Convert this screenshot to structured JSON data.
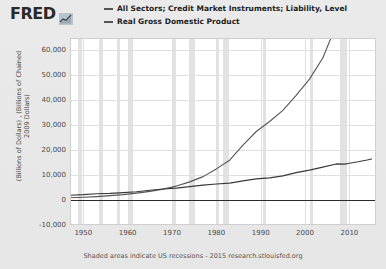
{
  "header": {
    "logo_text": "FRED",
    "logo_icon": "mini-line-chart-icon"
  },
  "legend": {
    "items": [
      {
        "label": "All Sectors; Credit Market Instruments; Liability, Level",
        "color": "#555555"
      },
      {
        "label": "Real Gross Domestic Product",
        "color": "#555555"
      }
    ]
  },
  "footer": {
    "note": "Shaded areas indicate US recessions - 2015 research.stlouisfed.org"
  },
  "chart_data": {
    "type": "line",
    "title": "",
    "subtitle": "",
    "xlabel": "",
    "ylabel": "(Billions of Dollars) , (Billions of Chained 2009 Dollars)",
    "xlim": [
      1947,
      2016
    ],
    "ylim": [
      -10000,
      65000
    ],
    "xticks": [
      "1950",
      "1960",
      "1970",
      "1980",
      "1990",
      "2000",
      "2010"
    ],
    "xtick_values": [
      1950,
      1960,
      1970,
      1980,
      1990,
      2000,
      2010
    ],
    "yticks": [
      "60,000",
      "50,000",
      "40,000",
      "30,000",
      "20,000",
      "10,000",
      "0",
      "-10,000"
    ],
    "ytick_values": [
      60000,
      50000,
      40000,
      30000,
      20000,
      10000,
      0,
      -10000
    ],
    "grid": true,
    "legend_position": "top",
    "zero_line": 0,
    "recessions": [
      {
        "start": 1948.9,
        "end": 1949.8
      },
      {
        "start": 1953.5,
        "end": 1954.4
      },
      {
        "start": 1957.6,
        "end": 1958.3
      },
      {
        "start": 1960.3,
        "end": 1961.1
      },
      {
        "start": 1969.9,
        "end": 1970.9
      },
      {
        "start": 1973.9,
        "end": 1975.2
      },
      {
        "start": 1980.0,
        "end": 1980.5
      },
      {
        "start": 1981.5,
        "end": 1982.9
      },
      {
        "start": 1990.5,
        "end": 1991.2
      },
      {
        "start": 2001.2,
        "end": 2001.9
      },
      {
        "start": 2007.9,
        "end": 2009.4
      }
    ],
    "series": [
      {
        "name": "All Sectors; Credit Market Instruments; Liability, Level",
        "color": "#555555",
        "x": [
          1947,
          1950,
          1953,
          1956,
          1959,
          1962,
          1965,
          1968,
          1971,
          1974,
          1977,
          1980,
          1983,
          1986,
          1989,
          1992,
          1995,
          1998,
          2001,
          2004,
          2007,
          2008,
          2009,
          2010,
          2011,
          2012,
          2013,
          2014,
          2015
        ],
        "values": [
          900,
          1100,
          1400,
          1800,
          2200,
          2800,
          3500,
          4400,
          5600,
          7300,
          9400,
          12500,
          16000,
          22000,
          27500,
          31500,
          36000,
          42000,
          48500,
          57000,
          70000,
          73000,
          71500,
          71000,
          72500,
          74500,
          77000,
          80000,
          82500
        ]
      },
      {
        "name": "Real Gross Domestic Product",
        "color": "#3a3a3a",
        "x": [
          1947,
          1950,
          1953,
          1956,
          1959,
          1962,
          1965,
          1968,
          1971,
          1974,
          1977,
          1980,
          1983,
          1986,
          1989,
          1992,
          1995,
          1998,
          2001,
          2004,
          2007,
          2009,
          2010,
          2012,
          2014,
          2015
        ],
        "values": [
          1930,
          2180,
          2550,
          2700,
          3000,
          3310,
          3930,
          4450,
          4800,
          5400,
          6000,
          6450,
          6800,
          7700,
          8500,
          8900,
          9700,
          11000,
          12000,
          13200,
          14500,
          14400,
          14800,
          15400,
          16100,
          16500
        ]
      }
    ]
  }
}
